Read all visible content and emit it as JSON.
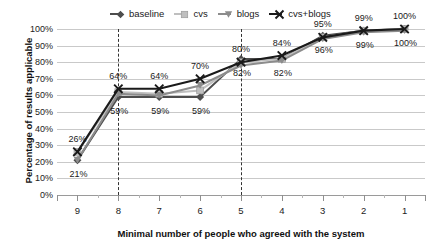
{
  "chart_data": {
    "type": "line",
    "title": "",
    "xlabel": "Minimal number of people who agreed with the system",
    "ylabel": "Percentage of results applicable",
    "categories": [
      "9",
      "8",
      "7",
      "6",
      "5",
      "4",
      "3",
      "2",
      "1"
    ],
    "x_axis_reversed": true,
    "ylim": [
      0,
      100
    ],
    "ytick_labels": [
      "0%",
      "10%",
      "20%",
      "30%",
      "40%",
      "50%",
      "60%",
      "70%",
      "80%",
      "90%",
      "100%"
    ],
    "ytick_values": [
      0,
      10,
      20,
      30,
      40,
      50,
      60,
      70,
      80,
      90,
      100
    ],
    "grid": true,
    "legend_position": "top",
    "reference_lines": [
      {
        "at_category": "8",
        "style": "dashed"
      },
      {
        "at_category": "5",
        "style": "dashed"
      }
    ],
    "series": [
      {
        "name": "baseline",
        "color": "#4d4d4d",
        "marker": "diamond",
        "values": [
          21,
          59,
          59,
          59,
          82,
          82,
          96,
          99,
          100
        ],
        "labels": [
          "21%",
          "59%",
          "59%",
          "59%",
          "82%",
          "82%",
          "96%",
          "99%",
          "100%"
        ],
        "label_position": "below"
      },
      {
        "name": "cvs",
        "color": "#bfbfbf",
        "marker": "square",
        "values": [
          26,
          62,
          61,
          63,
          80,
          82,
          95,
          99,
          100
        ],
        "labels": [
          "26%",
          "64%",
          "64%",
          "70%",
          "80%",
          "84%",
          "95%",
          "99%",
          "100%"
        ],
        "label_position": "above"
      },
      {
        "name": "blogs",
        "color": "#8c8c8c",
        "marker": "triangle",
        "values": [
          21,
          61,
          60,
          66,
          78,
          81,
          94,
          98,
          99
        ],
        "labels": [
          "",
          "",
          "",
          "",
          "",
          "",
          "",
          "",
          ""
        ],
        "label_position": "above"
      },
      {
        "name": "cvs+blogs",
        "color": "#1a1a1a",
        "marker": "x",
        "values": [
          26,
          64,
          64,
          70,
          80,
          84,
          95,
          99,
          100
        ],
        "labels": [
          "",
          "",
          "",
          "",
          "",
          "",
          "",
          "",
          ""
        ],
        "label_position": "above"
      }
    ],
    "point_annotations_above": [
      "26%",
      "64%",
      "64%",
      "70%",
      "80%",
      "84%",
      "95%",
      "99%",
      "100%"
    ],
    "point_annotations_below": [
      "21%",
      "59%",
      "59%",
      "59%",
      "82%",
      "82%",
      "96%",
      "99%",
      "100%"
    ]
  },
  "legend": {
    "items": [
      {
        "label": "baseline",
        "color": "#4d4d4d",
        "marker": "diamond"
      },
      {
        "label": "cvs",
        "color": "#bfbfbf",
        "marker": "square"
      },
      {
        "label": "blogs",
        "color": "#8c8c8c",
        "marker": "triangle"
      },
      {
        "label": "cvs+blogs",
        "color": "#1a1a1a",
        "marker": "x"
      }
    ]
  }
}
